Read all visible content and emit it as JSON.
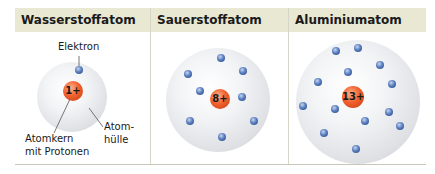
{
  "columns": [
    {
      "title": "Wasserstoffatom",
      "nucleus_charge": "1+",
      "electron_count": 1,
      "labels": {
        "electron": "Elektron",
        "nucleus_line1": "Atomkern",
        "nucleus_line2": "mit Protonen",
        "shell_line1": "Atom-",
        "shell_line2": "hülle"
      }
    },
    {
      "title": "Sauerstoffatom",
      "nucleus_charge": "8+",
      "electron_count": 8
    },
    {
      "title": "Aluminiumatom",
      "nucleus_charge": "13+",
      "electron_count": 13
    }
  ],
  "colors": {
    "header_bg": "#e9e8d2",
    "nucleus": "#f0612e",
    "electron": "#5a7fc0",
    "shell": "#e4e6ea"
  }
}
